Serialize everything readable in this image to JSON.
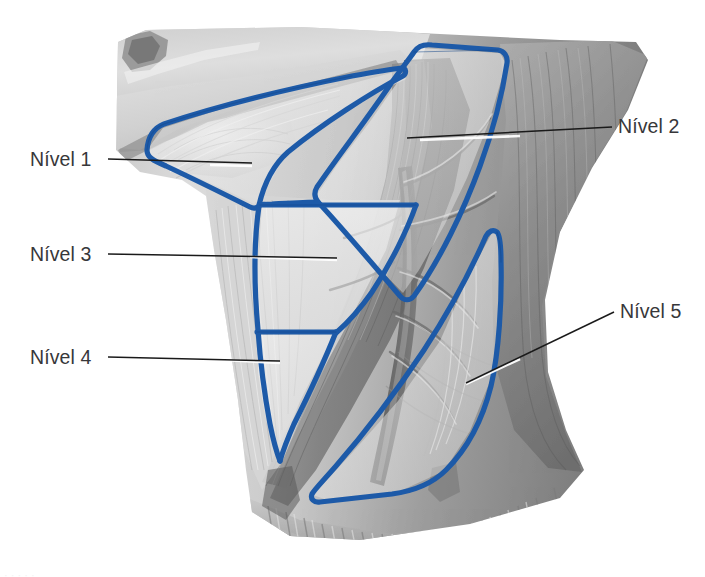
{
  "figure": {
    "kind": "anatomical-illustration",
    "background_color": "#ffffff",
    "outline_color": "#1d5aa8",
    "outline_color_dark": "#15478a",
    "label_color": "#37373a",
    "leader_color": "#1a1a1a",
    "leader_highlight_color": "#ffffff",
    "tissue_light": "#dcdcdc",
    "tissue_mid": "#b4b4b4",
    "tissue_dark": "#8a8a8a",
    "tissue_darkest": "#5e5e5e",
    "region_fill": "#f1f1f1"
  },
  "labels": [
    {
      "id": "nivel-1",
      "text": "Nível 1",
      "side": "left",
      "x": 30,
      "y": 150,
      "leader": {
        "x1": 108,
        "y1": 159,
        "x2": 252,
        "y2": 163
      }
    },
    {
      "id": "nivel-3",
      "text": "Nível 3",
      "side": "left",
      "x": 30,
      "y": 245,
      "leader": {
        "x1": 108,
        "y1": 254,
        "x2": 337,
        "y2": 259
      }
    },
    {
      "id": "nivel-4",
      "text": "Nível 4",
      "side": "left",
      "x": 30,
      "y": 348,
      "leader": {
        "x1": 108,
        "y1": 357,
        "x2": 280,
        "y2": 362
      }
    },
    {
      "id": "nivel-2",
      "text": "Nível 2",
      "side": "right",
      "x": 618,
      "y": 117,
      "leader": {
        "x1": 612,
        "y1": 127,
        "x2": 407,
        "y2": 137
      }
    },
    {
      "id": "nivel-5",
      "text": "Nível 5",
      "side": "right",
      "x": 620,
      "y": 302,
      "leader": {
        "x1": 614,
        "y1": 312,
        "x2": 466,
        "y2": 382
      }
    }
  ],
  "regions": [
    {
      "id": "region-level-1",
      "name": "level-1-submandibular-triangle"
    },
    {
      "id": "region-level-2",
      "name": "level-2-upper-jugular"
    },
    {
      "id": "region-level-3",
      "name": "level-3-middle-jugular"
    },
    {
      "id": "region-level-4",
      "name": "level-4-lower-jugular"
    },
    {
      "id": "region-level-5",
      "name": "level-5-posterior-triangle"
    }
  ],
  "caption": {
    "cut_off_text": "· · ·   · ·"
  }
}
